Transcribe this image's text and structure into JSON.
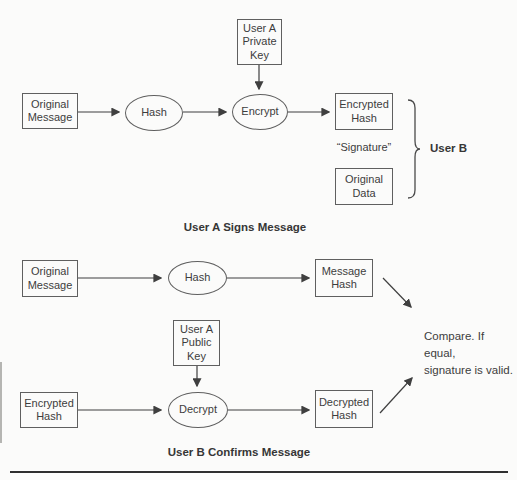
{
  "figure": {
    "top_section": {
      "caption": "User A Signs Message",
      "nodes": {
        "original_message": "Original\nMessage",
        "hash": "Hash",
        "private_key": "User A\nPrivate\nKey",
        "encrypt": "Encrypt",
        "encrypted_hash": "Encrypted\nHash",
        "signature_label": "“Signature”",
        "original_data": "Original\nData",
        "user_b_label": "User B"
      }
    },
    "bottom_section": {
      "caption": "User B Confirms Message",
      "nodes": {
        "original_message": "Original\nMessage",
        "hash": "Hash",
        "public_key": "User A\nPublic\nKey",
        "message_hash": "Message\nHash",
        "encrypted_hash": "Encrypted\nHash",
        "decrypt": "Decrypt",
        "decrypted_hash": "Decrypted\nHash",
        "compare_note": "Compare. If equal,\nsignature is valid."
      }
    },
    "colors": {
      "stroke": "#3f3f3f",
      "box_border": "#5f5f5f",
      "text": "#3d3d3d",
      "background": "#fbfbfa"
    }
  }
}
